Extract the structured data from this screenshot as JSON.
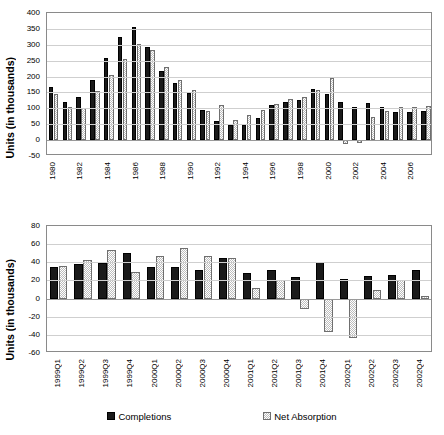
{
  "colors": {
    "completions": "#1a1a1a",
    "net_absorption": "#bdbdbd",
    "axis": "#8a8a8a",
    "grid": "#cfcfcf"
  },
  "legend": {
    "position": "bottom",
    "items": [
      {
        "label": "Completions",
        "style": "dark"
      },
      {
        "label": "Net Absorption",
        "style": "light"
      }
    ]
  },
  "chart_data": [
    {
      "id": "annual",
      "type": "bar",
      "title": "",
      "xlabel": "",
      "ylabel": "Units (in thousands)",
      "ylim": [
        -50,
        400
      ],
      "yticks": [
        400,
        350,
        300,
        250,
        200,
        150,
        100,
        50,
        0,
        -50
      ],
      "grid": true,
      "legend_position": "bottom",
      "tick_label_every": 2,
      "categories": [
        "1980",
        "1981",
        "1982",
        "1983",
        "1984",
        "1985",
        "1986",
        "1987",
        "1988",
        "1989",
        "1990",
        "1991",
        "1992",
        "1993",
        "1994",
        "1995",
        "1996",
        "1997",
        "1998",
        "1999",
        "2000",
        "2001",
        "2002",
        "2003",
        "2004",
        "2005",
        "2006",
        "2007"
      ],
      "series": [
        {
          "name": "Completions",
          "style": "dark",
          "values": [
            167,
            121,
            137,
            188,
            257,
            323,
            357,
            293,
            216,
            180,
            148,
            94,
            59,
            49,
            49,
            70,
            110,
            120,
            126,
            162,
            145,
            120,
            105,
            117,
            103,
            88,
            88,
            92
          ]
        },
        {
          "name": "Net Absorption",
          "style": "light",
          "values": [
            146,
            104,
            102,
            154,
            206,
            255,
            303,
            283,
            231,
            190,
            158,
            91,
            110,
            64,
            79,
            95,
            114,
            130,
            135,
            158,
            196,
            -12,
            -9,
            72,
            91,
            103,
            104,
            106
          ]
        }
      ]
    },
    {
      "id": "quarterly",
      "type": "bar",
      "title": "",
      "xlabel": "",
      "ylabel": "Units (in thousands)",
      "ylim": [
        -60,
        80
      ],
      "yticks": [
        80,
        60,
        40,
        20,
        0,
        -20,
        -40,
        -60
      ],
      "grid": true,
      "legend_position": "bottom",
      "tick_label_every": 1,
      "categories": [
        "1999Q1",
        "1999Q2",
        "1999Q3",
        "1999Q4",
        "2000Q1",
        "2000Q2",
        "2000Q3",
        "2000Q4",
        "2001Q1",
        "2001Q2",
        "2001Q3",
        "2001Q4",
        "2002Q1",
        "2002Q2",
        "2002Q3",
        "2002Q4"
      ],
      "series": [
        {
          "name": "Completions",
          "style": "dark",
          "values": [
            35,
            38,
            39,
            50,
            35,
            35,
            31,
            45,
            28,
            31,
            24,
            40,
            22,
            25,
            26,
            32
          ]
        },
        {
          "name": "Net Absorption",
          "style": "light",
          "values": [
            36,
            42,
            54,
            29,
            47,
            56,
            47,
            45,
            12,
            20,
            -12,
            -37,
            -44,
            9,
            20,
            3
          ]
        }
      ]
    }
  ]
}
